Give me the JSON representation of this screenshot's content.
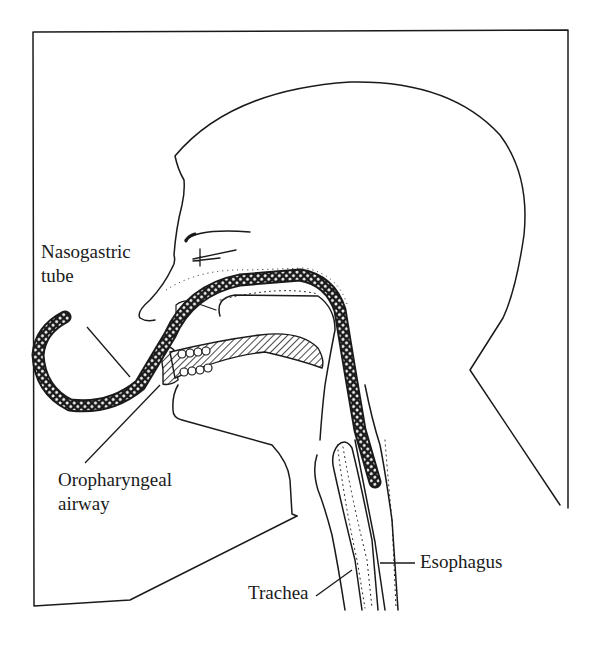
{
  "figure": {
    "type": "anatomical-diagram",
    "colors": {
      "ink": "#1a1a1a",
      "background": "#ffffff"
    }
  },
  "labels": {
    "nasogastric_line1": "Nasogastric",
    "nasogastric_line2": "tube",
    "oropharyngeal_line1": "Oropharyngeal",
    "oropharyngeal_line2": "airway",
    "esophagus": "Esophagus",
    "trachea": "Trachea"
  }
}
